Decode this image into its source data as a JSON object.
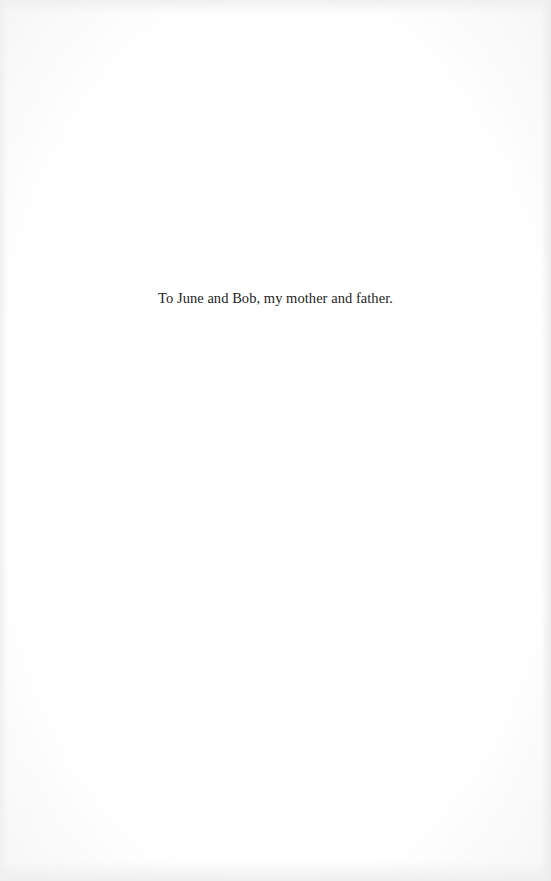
{
  "page": {
    "type": "dedication",
    "dedication_text": "To June and Bob, my mother and father."
  },
  "colors": {
    "background": "#fefefe",
    "text": "#1e1e1e"
  }
}
